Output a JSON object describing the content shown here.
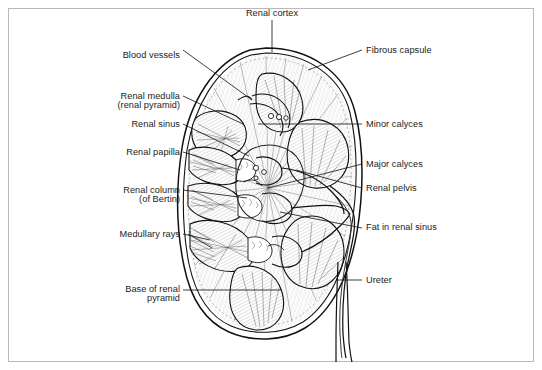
{
  "figure": {
    "border_color": "#b9b9b9",
    "ink_color": "#1b1b1b",
    "background": "#ffffff",
    "width": 542,
    "height": 370
  },
  "labels": {
    "top": [
      {
        "id": "renal-cortex",
        "text": "Renal cortex",
        "align": "center",
        "x": 272,
        "y": 12
      }
    ],
    "left": [
      {
        "id": "blood-vessels",
        "text": "Blood vessels",
        "align": "right",
        "x": 180,
        "y": 50
      },
      {
        "id": "renal-medulla",
        "text": "Renal medulla",
        "align": "right",
        "x": 180,
        "y": 91
      },
      {
        "id": "renal-pyramid",
        "text": "(renal pyramid)",
        "align": "right",
        "x": 180,
        "y": 100
      },
      {
        "id": "renal-sinus",
        "text": "Renal sinus",
        "align": "right",
        "x": 180,
        "y": 123
      },
      {
        "id": "renal-papilla",
        "text": "Renal papilla",
        "align": "right",
        "x": 180,
        "y": 150
      },
      {
        "id": "renal-column",
        "text": "Renal column",
        "align": "right",
        "x": 180,
        "y": 189
      },
      {
        "id": "of-bertin",
        "text": "(of Bertin)",
        "align": "right",
        "x": 180,
        "y": 198
      },
      {
        "id": "medullary-rays",
        "text": "Medullary rays",
        "align": "right",
        "x": 180,
        "y": 233
      },
      {
        "id": "base-of-renal",
        "text": "Base of renal",
        "align": "right",
        "x": 180,
        "y": 283
      },
      {
        "id": "pyramid",
        "text": "pyramid",
        "align": "right",
        "x": 180,
        "y": 292
      }
    ],
    "right": [
      {
        "id": "fibrous-capsule",
        "text": "Fibrous capsule",
        "align": "left",
        "x": 366,
        "y": 49
      },
      {
        "id": "minor-calyces",
        "text": "Minor calyces",
        "align": "left",
        "x": 366,
        "y": 123
      },
      {
        "id": "major-calyces",
        "text": "Major calyces",
        "align": "left",
        "x": 366,
        "y": 163
      },
      {
        "id": "renal-pelvis",
        "text": "Renal pelvis",
        "align": "left",
        "x": 366,
        "y": 187
      },
      {
        "id": "fat-in-renal-sinus",
        "text": "Fat in renal sinus",
        "align": "left",
        "x": 366,
        "y": 226
      },
      {
        "id": "ureter",
        "text": "Ureter",
        "align": "left",
        "x": 366,
        "y": 278
      }
    ]
  },
  "anatomy": {
    "structures": [
      "renal cortex",
      "fibrous capsule",
      "renal medulla (renal pyramid)",
      "renal column (of Bertin)",
      "medullary rays",
      "renal papilla",
      "minor calyces",
      "major calyces",
      "renal pelvis",
      "renal sinus",
      "fat in renal sinus",
      "blood vessels",
      "ureter",
      "base of renal pyramid"
    ]
  }
}
